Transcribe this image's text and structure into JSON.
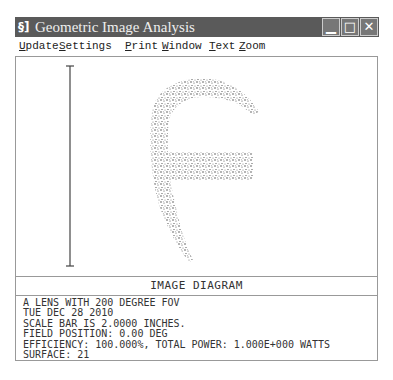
{
  "window": {
    "title": "Geometric Image Analysis",
    "app_icon": "§]",
    "controls": {
      "minimize": "▁",
      "maximize": "□",
      "close": "✕"
    }
  },
  "menu": {
    "items": [
      {
        "label": "Update",
        "mnemonic": "U",
        "rest": "pdate"
      },
      {
        "label": "Settings",
        "mnemonic": "S",
        "rest": "ettings"
      },
      {
        "label": "Print",
        "mnemonic": "P",
        "rest": "rint"
      },
      {
        "label": "Window",
        "mnemonic": "W",
        "rest": "indow"
      },
      {
        "label": "Text",
        "mnemonic": "T",
        "rest": "ext"
      },
      {
        "label": "Zoom",
        "mnemonic": "Z",
        "rest": "oom"
      }
    ]
  },
  "plot": {
    "scale_bar": "vertical scale bar",
    "figure": "spot diagram of letter F (ray scatter)"
  },
  "caption": "IMAGE DIAGRAM",
  "info": {
    "lines": [
      "A LENS WITH 200 DEGREE FOV",
      "TUE DEC 28 2010",
      "SCALE BAR IS 2.0000 INCHES.",
      "FIELD POSITION: 0.00 DEG",
      "EFFICIENCY: 100.000%, TOTAL POWER: 1.000E+000 WATTS",
      "SURFACE: 21"
    ]
  },
  "colors": {
    "titlebar": "#5a5a5a",
    "border": "#999999",
    "spots": "#333333"
  }
}
